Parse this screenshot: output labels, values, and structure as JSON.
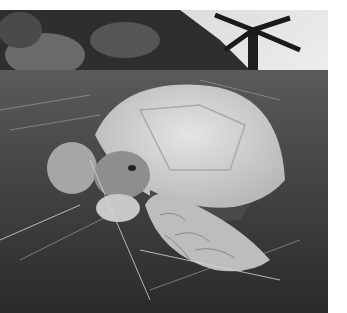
{
  "image": {
    "subject": "tortoise resting in dry grass",
    "style": "grayscale photograph",
    "alt": "Black-and-white photo of a tortoise resting on straw and grass with rocks and a palm in the background"
  }
}
